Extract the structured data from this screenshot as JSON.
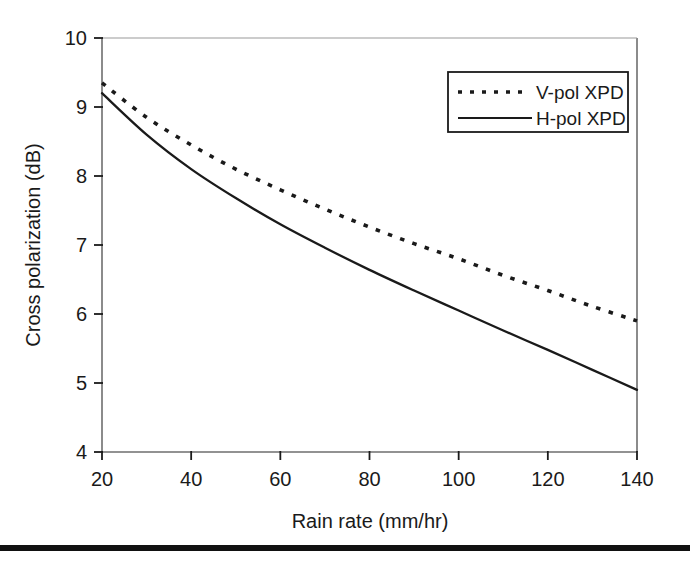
{
  "figure": {
    "name": "cross-polarization-vs-rain-rate",
    "background_color": "#ffffff",
    "ink_color": "#1a1a1a",
    "footer_rule_color": "#111111"
  },
  "chart_data": {
    "type": "line",
    "title": "",
    "xlabel": "Rain rate (mm/hr)",
    "ylabel": "Cross polarization (dB)",
    "xlim": [
      20,
      140
    ],
    "ylim": [
      4,
      10
    ],
    "xticks": [
      20,
      40,
      60,
      80,
      100,
      120,
      140
    ],
    "xtick_labels": [
      "20",
      "40",
      "60",
      "80",
      "100",
      "120",
      "140"
    ],
    "yticks": [
      4,
      5,
      6,
      7,
      8,
      9,
      10
    ],
    "ytick_labels": [
      "4",
      "5",
      "6",
      "7",
      "8",
      "9",
      "10"
    ],
    "grid": false,
    "legend_position": "upper right",
    "x": [
      20,
      30,
      40,
      50,
      60,
      70,
      80,
      90,
      100,
      110,
      120,
      130,
      140
    ],
    "series": [
      {
        "name": "V-pol XPD",
        "style": "dotted",
        "color": "#1a1a1a",
        "values": [
          9.35,
          8.85,
          8.45,
          8.1,
          7.8,
          7.52,
          7.26,
          7.02,
          6.8,
          6.56,
          6.34,
          6.11,
          5.9
        ]
      },
      {
        "name": "H-pol XPD",
        "style": "solid",
        "color": "#1a1a1a",
        "values": [
          9.2,
          8.6,
          8.1,
          7.68,
          7.3,
          6.96,
          6.64,
          6.34,
          6.05,
          5.76,
          5.48,
          5.19,
          4.9
        ]
      }
    ]
  },
  "legend": {
    "entries": [
      {
        "label": "V-pol XPD",
        "style": "dotted"
      },
      {
        "label": "H-pol XPD",
        "style": "solid"
      }
    ]
  }
}
